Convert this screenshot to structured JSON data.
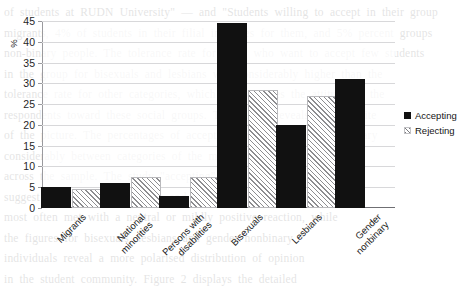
{
  "chart_data": {
    "type": "bar",
    "title": "",
    "xlabel": "",
    "ylabel": "%",
    "ylim": [
      0,
      45
    ],
    "ytick_step": 5,
    "yticks": [
      0,
      5,
      10,
      15,
      20,
      25,
      30,
      35,
      40,
      45
    ],
    "grid": true,
    "legend_position": "right",
    "categories": [
      "Migrants",
      "National\nminorities",
      "Persons with\ndisabilities",
      "Bisexuals",
      "Lesbians",
      "Gender\nnonbinary"
    ],
    "series": [
      {
        "name": "Accepting",
        "style": "solid",
        "color": "#111111",
        "values": [
          5,
          6,
          3,
          44.5,
          20,
          31
        ]
      },
      {
        "name": "Rejecting",
        "style": "hatched",
        "color": "#8d8d90",
        "values": [
          4.5,
          7.5,
          7.5,
          28.5,
          27,
          0
        ]
      }
    ]
  },
  "legend": {
    "items": [
      {
        "label": "Accepting"
      },
      {
        "label": "Rejecting"
      }
    ]
  },
  "ghost_text": "of students at RUDN University\" — and \"Students willing to accept in their group\nmigrants, 4% of students in their filial institutes for them, and 5% percent groups\nnon-binary people. The tolerance rate for those who want to accept few students\nin the group for bisexuals and lesbians was considerably higher than the\ntolerance rate for other categories, which demonstrates the attitude of the\nrespondents toward these social groups. The survey reveals the opposite\nof the picture. The percentages of accepting and rejecting attitudes vary\nconsiderably between categories of the minority groups in question\nacross the sample. The study \"accepting\" and \"rejecting\" indicators\nsuggest that national minorities and persons with disabilities are\nmost often met with a neutral or mildly positive reaction, while\nthe figures for bisexuals, lesbians and gender nonbinary\nindividuals reveal a more polarised distribution of opinion\nin the student community. Figure 2 displays the detailed\ndistribution of responses across all six categories for\nthe two attitude types under consideration here."
}
